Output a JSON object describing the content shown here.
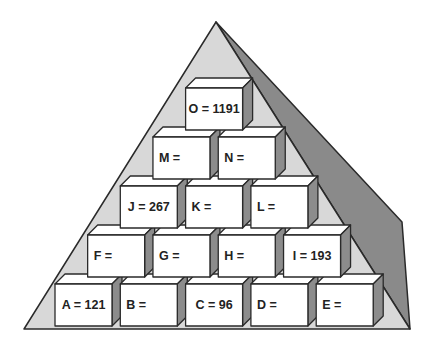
{
  "diagram": {
    "type": "number-pyramid",
    "colors": {
      "pyramid_face": "#d8d8d8",
      "pyramid_side": "#8a8a8a",
      "outline": "#2a2a2a",
      "box_front": "#ffffff",
      "box_top": "#ffffff",
      "box_side": "#8c8c8c",
      "text": "#222222"
    },
    "rows": [
      {
        "row": 1,
        "boxes": [
          {
            "id": "A",
            "label": "A = 121",
            "value": 121
          },
          {
            "id": "B",
            "label": "B =",
            "value": null
          },
          {
            "id": "C",
            "label": "C = 96",
            "value": 96
          },
          {
            "id": "D",
            "label": "D =",
            "value": null
          },
          {
            "id": "E",
            "label": "E =",
            "value": null
          }
        ]
      },
      {
        "row": 2,
        "boxes": [
          {
            "id": "F",
            "label": "F =",
            "value": null
          },
          {
            "id": "G",
            "label": "G =",
            "value": null
          },
          {
            "id": "H",
            "label": "H =",
            "value": null
          },
          {
            "id": "I",
            "label": "I = 193",
            "value": 193
          }
        ]
      },
      {
        "row": 3,
        "boxes": [
          {
            "id": "J",
            "label": "J = 267",
            "value": 267
          },
          {
            "id": "K",
            "label": "K =",
            "value": null
          },
          {
            "id": "L",
            "label": "L =",
            "value": null
          }
        ]
      },
      {
        "row": 4,
        "boxes": [
          {
            "id": "M",
            "label": "M =",
            "value": null
          },
          {
            "id": "N",
            "label": "N =",
            "value": null
          }
        ]
      },
      {
        "row": 5,
        "boxes": [
          {
            "id": "O",
            "label": "O = 1191",
            "value": 1191
          }
        ]
      }
    ]
  }
}
